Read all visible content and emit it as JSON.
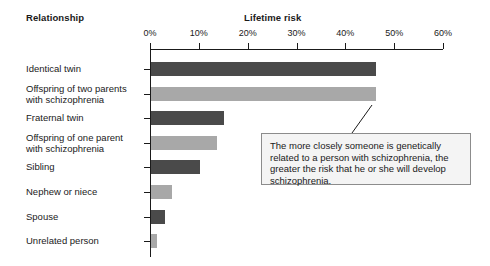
{
  "headers": {
    "relationship": "Relationship",
    "lifetime_risk": "Lifetime risk"
  },
  "callout": {
    "text": "The more closely someone is genetically related to a person with schizophrenia, the greater the risk that he or she will develop schizophrenia."
  },
  "colors": {
    "bar_dark": "#4a4a4a",
    "bar_light": "#a8a8a8",
    "axis": "#1a1a1a",
    "callout_fill": "#f4f4f4",
    "callout_border": "#8c8c8c",
    "background": "#ffffff"
  },
  "chart_data": {
    "type": "bar",
    "orientation": "horizontal",
    "title": "",
    "xlabel": "Lifetime risk",
    "ylabel": "Relationship",
    "xlim": [
      0,
      60
    ],
    "grid": false,
    "legend": "none",
    "tick_labels": [
      "0%",
      "10%",
      "20%",
      "30%",
      "40%",
      "50%",
      "60%"
    ],
    "tick_values": [
      0,
      10,
      20,
      30,
      40,
      50,
      60
    ],
    "categories": [
      "Identical twin",
      "Offspring of two parents\nwith schizophrenia",
      "Fraternal twin",
      "Offspring of one parent\nwith schizophrenia",
      "Sibling",
      "Nephew or niece",
      "Spouse",
      "Unrelated person"
    ],
    "values": [
      46,
      46,
      15,
      13.5,
      10,
      4.3,
      2.9,
      1.2
    ],
    "bar_colors": [
      "#4a4a4a",
      "#a8a8a8",
      "#4a4a4a",
      "#a8a8a8",
      "#4a4a4a",
      "#a8a8a8",
      "#4a4a4a",
      "#a8a8a8"
    ],
    "annotations": [
      {
        "text": "The more closely someone is genetically related to a person with schizophrenia, the greater the risk that he or she will develop schizophrenia.",
        "points_to": "Offspring of two parents with schizophrenia"
      }
    ]
  }
}
